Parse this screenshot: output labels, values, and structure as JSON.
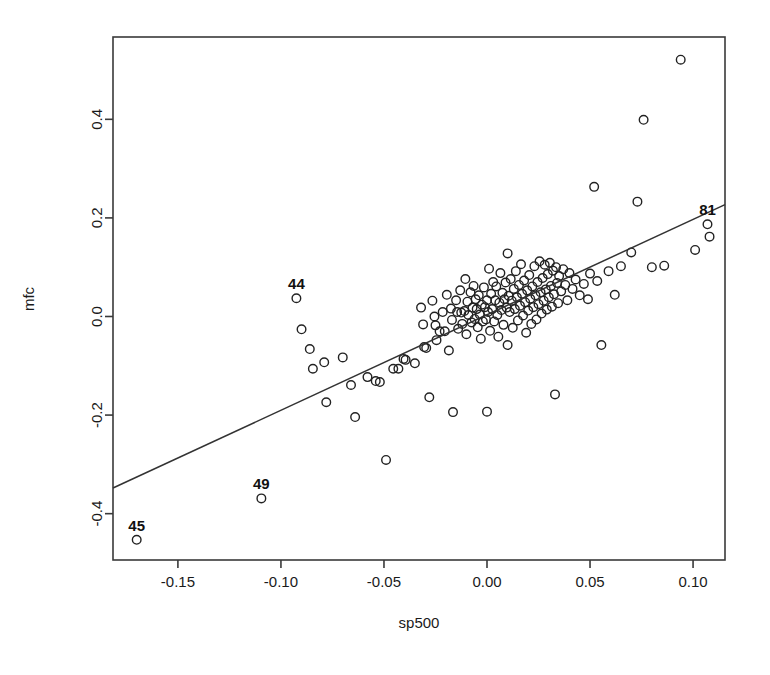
{
  "chart_data": {
    "type": "scatter",
    "title": "",
    "xlabel": "sp500",
    "ylabel": "mfc",
    "xlim": [
      -0.1815,
      0.1155
    ],
    "ylim": [
      -0.494,
      0.567
    ],
    "grid": false,
    "legend": "none",
    "xticks": [
      -0.15,
      -0.1,
      -0.05,
      0.0,
      0.05,
      0.1
    ],
    "xticklabels": [
      "-0.15",
      "-0.10",
      "-0.05",
      "0.00",
      "0.05",
      "0.10"
    ],
    "yticks": [
      -0.4,
      -0.2,
      0.0,
      0.2,
      0.4
    ],
    "yticklabels": [
      "-0.4",
      "-0.2",
      "0.0",
      "0.2",
      "0.4"
    ],
    "marker": "open-circle",
    "marker_color": "#222222",
    "line_color": "#333333",
    "fit_line": {
      "type": "linear",
      "x0": -0.1815,
      "y0": -0.348,
      "x1": 0.1155,
      "y1": 0.227,
      "slope": 1.936,
      "intercept": 0.0035
    },
    "annotations": [
      {
        "label": "44",
        "x": -0.0925,
        "y": 0.037
      },
      {
        "label": "49",
        "x": -0.1095,
        "y": -0.369
      },
      {
        "label": "45",
        "x": -0.17,
        "y": -0.453
      },
      {
        "label": "81",
        "x": 0.107,
        "y": 0.187
      }
    ],
    "points": [
      [
        -0.17,
        -0.453
      ],
      [
        -0.1095,
        -0.369
      ],
      [
        -0.0925,
        0.037
      ],
      [
        -0.09,
        -0.026
      ],
      [
        -0.086,
        -0.066
      ],
      [
        -0.0845,
        -0.106
      ],
      [
        -0.079,
        -0.093
      ],
      [
        -0.078,
        -0.174
      ],
      [
        -0.07,
        -0.083
      ],
      [
        -0.066,
        -0.139
      ],
      [
        -0.064,
        -0.204
      ],
      [
        -0.058,
        -0.123
      ],
      [
        -0.054,
        -0.131
      ],
      [
        -0.052,
        -0.133
      ],
      [
        -0.049,
        -0.291
      ],
      [
        -0.0455,
        -0.106
      ],
      [
        -0.043,
        -0.106
      ],
      [
        -0.0405,
        -0.086
      ],
      [
        -0.0395,
        -0.088
      ],
      [
        -0.035,
        -0.095
      ],
      [
        -0.032,
        0.018
      ],
      [
        -0.031,
        -0.016
      ],
      [
        -0.0305,
        -0.062
      ],
      [
        -0.0295,
        -0.064
      ],
      [
        -0.028,
        -0.164
      ],
      [
        -0.0265,
        0.032
      ],
      [
        -0.0255,
        0.0
      ],
      [
        -0.025,
        -0.018
      ],
      [
        -0.0245,
        -0.048
      ],
      [
        -0.023,
        -0.03
      ],
      [
        -0.0215,
        0.009
      ],
      [
        -0.0205,
        -0.03
      ],
      [
        -0.0195,
        0.044
      ],
      [
        -0.0185,
        -0.069
      ],
      [
        -0.0175,
        0.016
      ],
      [
        -0.017,
        -0.007
      ],
      [
        -0.0165,
        -0.194
      ],
      [
        -0.015,
        0.033
      ],
      [
        -0.0145,
        0.009
      ],
      [
        -0.014,
        -0.025
      ],
      [
        -0.013,
        0.053
      ],
      [
        -0.0125,
        0.008
      ],
      [
        -0.012,
        -0.015
      ],
      [
        -0.011,
        0.011
      ],
      [
        -0.0105,
        0.076
      ],
      [
        -0.01,
        -0.036
      ],
      [
        -0.0095,
        0.03
      ],
      [
        -0.009,
        0.003
      ],
      [
        -0.008,
        0.049
      ],
      [
        -0.0075,
        -0.012
      ],
      [
        -0.007,
        0.018
      ],
      [
        -0.0065,
        0.062
      ],
      [
        -0.006,
        -0.005
      ],
      [
        -0.0055,
        0.035
      ],
      [
        -0.005,
        0.015
      ],
      [
        -0.0045,
        -0.022
      ],
      [
        -0.004,
        0.043
      ],
      [
        -0.0035,
        0.004
      ],
      [
        -0.003,
        -0.045
      ],
      [
        -0.0025,
        0.024
      ],
      [
        -0.002,
        -0.01
      ],
      [
        -0.0015,
        0.059
      ],
      [
        -0.001,
        0.019
      ],
      [
        -0.0005,
        -0.006
      ],
      [
        0.0,
        -0.193
      ],
      [
        0.0,
        0.033
      ],
      [
        0.0005,
        0.009
      ],
      [
        0.001,
        0.097
      ],
      [
        0.0015,
        -0.029
      ],
      [
        0.002,
        0.046
      ],
      [
        0.0025,
        0.015
      ],
      [
        0.003,
        0.07
      ],
      [
        0.0035,
        -0.01
      ],
      [
        0.004,
        0.033
      ],
      [
        0.0045,
        0.061
      ],
      [
        0.005,
        0.003
      ],
      [
        0.0055,
        -0.041
      ],
      [
        0.006,
        0.028
      ],
      [
        0.0065,
        0.088
      ],
      [
        0.007,
        0.013
      ],
      [
        0.0075,
        0.048
      ],
      [
        0.008,
        -0.017
      ],
      [
        0.0085,
        0.035
      ],
      [
        0.009,
        0.069
      ],
      [
        0.0095,
        0.018
      ],
      [
        0.01,
        0.128
      ],
      [
        0.01,
        -0.058
      ],
      [
        0.0105,
        0.042
      ],
      [
        0.011,
        0.009
      ],
      [
        0.0115,
        0.076
      ],
      [
        0.012,
        0.032
      ],
      [
        0.0125,
        -0.023
      ],
      [
        0.013,
        0.056
      ],
      [
        0.0135,
        0.015
      ],
      [
        0.014,
        0.092
      ],
      [
        0.0145,
        0.039
      ],
      [
        0.015,
        -0.008
      ],
      [
        0.0155,
        0.064
      ],
      [
        0.016,
        0.022
      ],
      [
        0.0165,
        0.106
      ],
      [
        0.017,
        0.046
      ],
      [
        0.0175,
        0.002
      ],
      [
        0.018,
        0.073
      ],
      [
        0.0185,
        0.029
      ],
      [
        0.019,
        -0.033
      ],
      [
        0.0195,
        0.053
      ],
      [
        0.02,
        0.012
      ],
      [
        0.0205,
        0.084
      ],
      [
        0.021,
        0.036
      ],
      [
        0.0215,
        -0.015
      ],
      [
        0.022,
        0.061
      ],
      [
        0.0225,
        0.019
      ],
      [
        0.023,
        0.102
      ],
      [
        0.0235,
        0.043
      ],
      [
        0.024,
        -0.006
      ],
      [
        0.0245,
        0.07
      ],
      [
        0.025,
        0.025
      ],
      [
        0.0255,
        0.112
      ],
      [
        0.026,
        0.049
      ],
      [
        0.0265,
        0.006
      ],
      [
        0.027,
        0.078
      ],
      [
        0.0275,
        0.032
      ],
      [
        0.028,
        0.105
      ],
      [
        0.0285,
        0.055
      ],
      [
        0.029,
        0.014
      ],
      [
        0.0295,
        0.086
      ],
      [
        0.03,
        0.039
      ],
      [
        0.0305,
        0.109
      ],
      [
        0.031,
        0.062
      ],
      [
        0.0315,
        0.02
      ],
      [
        0.032,
        0.093
      ],
      [
        0.0325,
        0.045
      ],
      [
        0.033,
        -0.158
      ],
      [
        0.0335,
        0.1
      ],
      [
        0.034,
        0.068
      ],
      [
        0.0345,
        0.027
      ],
      [
        0.035,
        0.082
      ],
      [
        0.036,
        0.051
      ],
      [
        0.037,
        0.096
      ],
      [
        0.038,
        0.064
      ],
      [
        0.039,
        0.033
      ],
      [
        0.04,
        0.088
      ],
      [
        0.0415,
        0.056
      ],
      [
        0.043,
        0.075
      ],
      [
        0.045,
        0.043
      ],
      [
        0.047,
        0.066
      ],
      [
        0.049,
        0.035
      ],
      [
        0.05,
        0.087
      ],
      [
        0.052,
        0.263
      ],
      [
        0.0535,
        0.072
      ],
      [
        0.0555,
        -0.058
      ],
      [
        0.059,
        0.092
      ],
      [
        0.062,
        0.044
      ],
      [
        0.065,
        0.102
      ],
      [
        0.07,
        0.13
      ],
      [
        0.073,
        0.233
      ],
      [
        0.076,
        0.399
      ],
      [
        0.08,
        0.1
      ],
      [
        0.086,
        0.103
      ],
      [
        0.094,
        0.521
      ],
      [
        0.101,
        0.135
      ],
      [
        0.107,
        0.187
      ],
      [
        0.108,
        0.162
      ]
    ]
  },
  "figure": {
    "plot_box": {
      "left": 113,
      "top": 37,
      "right": 725,
      "bottom": 560
    },
    "background": "#ffffff",
    "frame_color": "#3a3a3a"
  }
}
